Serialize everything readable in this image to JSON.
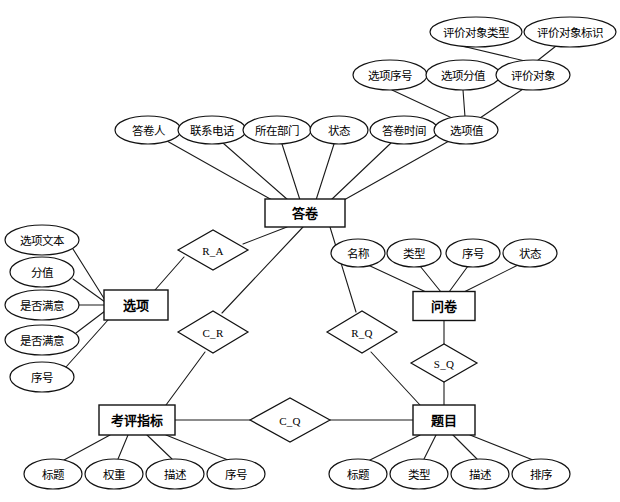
{
  "diagram": {
    "type": "entity-relationship-diagram",
    "background_color": "#ffffff",
    "line_color": "#111111",
    "entities": [
      {
        "id": "answer_sheet",
        "label": "答卷",
        "x": 305,
        "y": 213,
        "w": 80,
        "h": 28
      },
      {
        "id": "option",
        "label": "选项",
        "x": 136,
        "y": 305,
        "w": 64,
        "h": 30
      },
      {
        "id": "questionnaire",
        "label": "问卷",
        "x": 444,
        "y": 306,
        "w": 62,
        "h": 29
      },
      {
        "id": "indicator",
        "label": "考评指标",
        "x": 137,
        "y": 420,
        "w": 76,
        "h": 30
      },
      {
        "id": "question",
        "label": "题目",
        "x": 444,
        "y": 420,
        "w": 62,
        "h": 30
      }
    ],
    "relationships": [
      {
        "id": "R_A",
        "label": "R_A",
        "x": 213,
        "y": 250,
        "rx": 35,
        "ry": 20,
        "connects": [
          "answer_sheet",
          "option"
        ]
      },
      {
        "id": "C_R",
        "label": "C_R",
        "x": 213,
        "y": 332,
        "rx": 35,
        "ry": 21,
        "connects": [
          "answer_sheet",
          "indicator"
        ]
      },
      {
        "id": "R_Q",
        "label": "R_Q",
        "x": 362,
        "y": 332,
        "rx": 35,
        "ry": 21,
        "connects": [
          "answer_sheet",
          "question"
        ]
      },
      {
        "id": "S_Q",
        "label": "S_Q",
        "x": 444,
        "y": 363,
        "rx": 33,
        "ry": 19,
        "connects": [
          "questionnaire",
          "question"
        ]
      },
      {
        "id": "C_Q",
        "label": "C_Q",
        "x": 290,
        "y": 420,
        "rx": 40,
        "ry": 22,
        "connects": [
          "indicator",
          "question"
        ]
      }
    ],
    "attributes": [
      {
        "id": "attr_eval_obj_type",
        "label": "评价对象类型",
        "x": 476,
        "y": 32,
        "rx": 46,
        "ry": 15,
        "owner": "attr_eval_obj"
      },
      {
        "id": "attr_eval_obj_id",
        "label": "评价对象标识",
        "x": 570,
        "y": 32,
        "rx": 46,
        "ry": 15,
        "owner": "attr_eval_obj"
      },
      {
        "id": "attr_opt_seq",
        "label": "选项序号",
        "x": 390,
        "y": 75,
        "rx": 37,
        "ry": 15,
        "owner": "attr_option_value"
      },
      {
        "id": "attr_opt_score",
        "label": "选项分值",
        "x": 463,
        "y": 75,
        "rx": 37,
        "ry": 15,
        "owner": "attr_option_value"
      },
      {
        "id": "attr_eval_obj",
        "label": "评价对象",
        "x": 533,
        "y": 75,
        "rx": 37,
        "ry": 15,
        "owner": "attr_option_value"
      },
      {
        "id": "attr_respondent",
        "label": "答卷人",
        "x": 148,
        "y": 130,
        "rx": 33,
        "ry": 14,
        "owner": "answer_sheet"
      },
      {
        "id": "attr_phone",
        "label": "联系电话",
        "x": 212,
        "y": 130,
        "rx": 34,
        "ry": 14,
        "owner": "answer_sheet"
      },
      {
        "id": "attr_dept",
        "label": "所在部门",
        "x": 277,
        "y": 130,
        "rx": 34,
        "ry": 14,
        "owner": "answer_sheet"
      },
      {
        "id": "attr_status_a",
        "label": "状态",
        "x": 339,
        "y": 130,
        "rx": 29,
        "ry": 14,
        "owner": "answer_sheet"
      },
      {
        "id": "attr_answer_time",
        "label": "答卷时间",
        "x": 404,
        "y": 130,
        "rx": 34,
        "ry": 14,
        "owner": "answer_sheet"
      },
      {
        "id": "attr_option_value",
        "label": "选项值",
        "x": 466,
        "y": 130,
        "rx": 32,
        "ry": 14,
        "owner": "answer_sheet"
      },
      {
        "id": "attr_opt_text",
        "label": "选项文本",
        "x": 42,
        "y": 240,
        "rx": 37,
        "ry": 15,
        "owner": "option"
      },
      {
        "id": "attr_score",
        "label": "分值",
        "x": 42,
        "y": 272,
        "rx": 32,
        "ry": 15,
        "owner": "option"
      },
      {
        "id": "attr_satisfied_1",
        "label": "是否满意",
        "x": 42,
        "y": 305,
        "rx": 37,
        "ry": 15,
        "owner": "option"
      },
      {
        "id": "attr_satisfied_2",
        "label": "是否满意",
        "x": 42,
        "y": 340,
        "rx": 37,
        "ry": 15,
        "owner": "option"
      },
      {
        "id": "attr_seq_opt",
        "label": "序号",
        "x": 42,
        "y": 377,
        "rx": 32,
        "ry": 15,
        "owner": "option"
      },
      {
        "id": "attr_name_q",
        "label": "名称",
        "x": 358,
        "y": 253,
        "rx": 27,
        "ry": 14,
        "owner": "questionnaire"
      },
      {
        "id": "attr_type_q",
        "label": "类型",
        "x": 414,
        "y": 253,
        "rx": 27,
        "ry": 14,
        "owner": "questionnaire"
      },
      {
        "id": "attr_seq_q",
        "label": "序号",
        "x": 473,
        "y": 253,
        "rx": 27,
        "ry": 14,
        "owner": "questionnaire"
      },
      {
        "id": "attr_status_q",
        "label": "状态",
        "x": 530,
        "y": 253,
        "rx": 27,
        "ry": 14,
        "owner": "questionnaire"
      },
      {
        "id": "attr_title_i",
        "label": "标题",
        "x": 53,
        "y": 474,
        "rx": 29,
        "ry": 15,
        "owner": "indicator"
      },
      {
        "id": "attr_weight_i",
        "label": "权重",
        "x": 114,
        "y": 474,
        "rx": 29,
        "ry": 15,
        "owner": "indicator"
      },
      {
        "id": "attr_desc_i",
        "label": "描述",
        "x": 175,
        "y": 474,
        "rx": 29,
        "ry": 15,
        "owner": "indicator"
      },
      {
        "id": "attr_seq_i",
        "label": "序号",
        "x": 236,
        "y": 474,
        "rx": 29,
        "ry": 15,
        "owner": "indicator"
      },
      {
        "id": "attr_title_t",
        "label": "标题",
        "x": 358,
        "y": 474,
        "rx": 29,
        "ry": 15,
        "owner": "question"
      },
      {
        "id": "attr_type_t",
        "label": "类型",
        "x": 419,
        "y": 474,
        "rx": 29,
        "ry": 15,
        "owner": "question"
      },
      {
        "id": "attr_desc_t",
        "label": "描述",
        "x": 480,
        "y": 474,
        "rx": 29,
        "ry": 15,
        "owner": "question"
      },
      {
        "id": "attr_order_t",
        "label": "排序",
        "x": 541,
        "y": 474,
        "rx": 29,
        "ry": 15,
        "owner": "question"
      }
    ],
    "edges": [
      {
        "from": "attr_eval_obj_type",
        "to": "attr_eval_obj",
        "x1": 462,
        "y1": 46,
        "x2": 525,
        "y2": 61
      },
      {
        "from": "attr_eval_obj_id",
        "to": "attr_eval_obj",
        "x1": 556,
        "y1": 46,
        "x2": 537,
        "y2": 61
      },
      {
        "from": "attr_opt_seq",
        "to": "attr_option_value",
        "x1": 392,
        "y1": 90,
        "x2": 452,
        "y2": 118
      },
      {
        "from": "attr_opt_score",
        "to": "attr_option_value",
        "x1": 463,
        "y1": 90,
        "x2": 465,
        "y2": 117
      },
      {
        "from": "attr_eval_obj",
        "to": "attr_option_value",
        "x1": 523,
        "y1": 89,
        "x2": 480,
        "y2": 118
      },
      {
        "from": "attr_respondent",
        "to": "answer_sheet",
        "x1": 167,
        "y1": 141,
        "x2": 272,
        "y2": 200
      },
      {
        "from": "attr_phone",
        "to": "answer_sheet",
        "x1": 223,
        "y1": 143,
        "x2": 288,
        "y2": 200
      },
      {
        "from": "attr_dept",
        "to": "answer_sheet",
        "x1": 282,
        "y1": 144,
        "x2": 300,
        "y2": 200
      },
      {
        "from": "attr_status_a",
        "to": "answer_sheet",
        "x1": 334,
        "y1": 144,
        "x2": 316,
        "y2": 200
      },
      {
        "from": "attr_answer_time",
        "to": "answer_sheet",
        "x1": 391,
        "y1": 143,
        "x2": 331,
        "y2": 200
      },
      {
        "from": "attr_option_value",
        "to": "answer_sheet",
        "x1": 449,
        "y1": 141,
        "x2": 344,
        "y2": 200
      },
      {
        "from": "answer_sheet",
        "to": "R_A",
        "x1": 287,
        "y1": 227,
        "x2": 243,
        "y2": 244
      },
      {
        "from": "R_A",
        "to": "option",
        "x1": 184,
        "y1": 257,
        "x2": 155,
        "y2": 290
      },
      {
        "from": "answer_sheet",
        "to": "C_R",
        "x1": 303,
        "y1": 227,
        "x2": 222,
        "y2": 313
      },
      {
        "from": "C_R",
        "to": "indicator",
        "x1": 205,
        "y1": 352,
        "x2": 166,
        "y2": 405
      },
      {
        "from": "answer_sheet",
        "to": "R_Q",
        "x1": 330,
        "y1": 227,
        "x2": 356,
        "y2": 312
      },
      {
        "from": "R_Q",
        "to": "question",
        "x1": 371,
        "y1": 352,
        "x2": 420,
        "y2": 405
      },
      {
        "from": "attr_opt_text",
        "to": "option",
        "x1": 73,
        "y1": 249,
        "x2": 105,
        "y2": 300
      },
      {
        "from": "attr_score",
        "to": "option",
        "x1": 73,
        "y1": 279,
        "x2": 105,
        "y2": 302
      },
      {
        "from": "attr_satisfied_1",
        "to": "option",
        "x1": 79,
        "y1": 305,
        "x2": 105,
        "y2": 305
      },
      {
        "from": "attr_satisfied_2",
        "to": "option",
        "x1": 76,
        "y1": 333,
        "x2": 105,
        "y2": 311
      },
      {
        "from": "attr_seq_opt",
        "to": "option",
        "x1": 66,
        "y1": 367,
        "x2": 108,
        "y2": 320
      },
      {
        "from": "attr_name_q",
        "to": "questionnaire",
        "x1": 368,
        "y1": 265,
        "x2": 426,
        "y2": 292
      },
      {
        "from": "attr_type_q",
        "to": "questionnaire",
        "x1": 420,
        "y1": 266,
        "x2": 441,
        "y2": 292
      },
      {
        "from": "attr_seq_q",
        "to": "questionnaire",
        "x1": 468,
        "y1": 266,
        "x2": 449,
        "y2": 292
      },
      {
        "from": "attr_status_q",
        "to": "questionnaire",
        "x1": 518,
        "y1": 265,
        "x2": 464,
        "y2": 292
      },
      {
        "from": "questionnaire",
        "to": "S_Q",
        "x1": 444,
        "y1": 320,
        "x2": 444,
        "y2": 344
      },
      {
        "from": "S_Q",
        "to": "question",
        "x1": 444,
        "y1": 382,
        "x2": 444,
        "y2": 405
      },
      {
        "from": "indicator",
        "to": "C_Q",
        "x1": 175,
        "y1": 420,
        "x2": 250,
        "y2": 420
      },
      {
        "from": "C_Q",
        "to": "question",
        "x1": 330,
        "y1": 420,
        "x2": 413,
        "y2": 420
      },
      {
        "from": "attr_title_i",
        "to": "indicator",
        "x1": 64,
        "y1": 460,
        "x2": 110,
        "y2": 435
      },
      {
        "from": "attr_weight_i",
        "to": "indicator",
        "x1": 118,
        "y1": 459,
        "x2": 128,
        "y2": 435
      },
      {
        "from": "attr_desc_i",
        "to": "indicator",
        "x1": 172,
        "y1": 459,
        "x2": 147,
        "y2": 435
      },
      {
        "from": "attr_seq_i",
        "to": "indicator",
        "x1": 228,
        "y1": 460,
        "x2": 166,
        "y2": 435
      },
      {
        "from": "attr_title_t",
        "to": "question",
        "x1": 370,
        "y1": 460,
        "x2": 420,
        "y2": 435
      },
      {
        "from": "attr_type_t",
        "to": "question",
        "x1": 424,
        "y1": 459,
        "x2": 436,
        "y2": 435
      },
      {
        "from": "attr_desc_t",
        "to": "question",
        "x1": 477,
        "y1": 459,
        "x2": 453,
        "y2": 435
      },
      {
        "from": "attr_order_t",
        "to": "question",
        "x1": 533,
        "y1": 460,
        "x2": 470,
        "y2": 435
      }
    ]
  }
}
